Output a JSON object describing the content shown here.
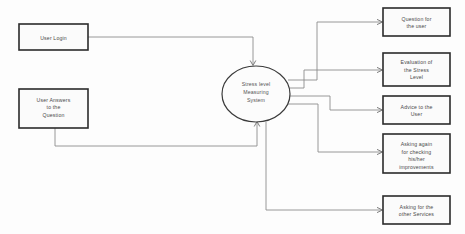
{
  "diagram": {
    "type": "data-flow-diagram",
    "level": "context",
    "title": "",
    "colors": {
      "background": "#fdfdfd",
      "box_stroke": "#2b2b2b",
      "box_fill": "#fbfbfb",
      "ellipse_stroke": "#3a3a3a",
      "ellipse_fill": "#fcfcfc",
      "line": "#8c8c8c",
      "text": "#4a4a4a"
    },
    "process": {
      "shape": "ellipse",
      "lines": [
        "Stress level",
        "Measuring",
        "System"
      ]
    },
    "inputs": [
      {
        "id": "user-login",
        "shape": "rectangle",
        "lines": [
          "User Login"
        ]
      },
      {
        "id": "user-answers",
        "shape": "rectangle",
        "lines": [
          "User Answers",
          "to the",
          "Question"
        ]
      }
    ],
    "outputs": [
      {
        "id": "question-for-user",
        "shape": "rectangle",
        "lines": [
          "Question for",
          "the user"
        ]
      },
      {
        "id": "evaluation-of-stress-level",
        "shape": "rectangle",
        "lines": [
          "Evaluation of",
          "the Stress",
          "Level"
        ]
      },
      {
        "id": "advice-to-user",
        "shape": "rectangle",
        "lines": [
          "Advice to the",
          "User"
        ]
      },
      {
        "id": "asking-again-improvements",
        "shape": "rectangle",
        "lines": [
          "Asking again",
          "for checking",
          "his/her",
          "improvements"
        ]
      },
      {
        "id": "asking-other-services",
        "shape": "rectangle",
        "lines": [
          "Asking for the",
          "other Services"
        ]
      }
    ],
    "flows": [
      {
        "from": "user-login",
        "to": "stress-level-measuring-system"
      },
      {
        "from": "user-answers",
        "to": "stress-level-measuring-system"
      },
      {
        "from": "stress-level-measuring-system",
        "to": "question-for-user"
      },
      {
        "from": "stress-level-measuring-system",
        "to": "evaluation-of-stress-level"
      },
      {
        "from": "stress-level-measuring-system",
        "to": "advice-to-user"
      },
      {
        "from": "stress-level-measuring-system",
        "to": "asking-again-improvements"
      },
      {
        "from": "stress-level-measuring-system",
        "to": "asking-other-services"
      }
    ]
  }
}
